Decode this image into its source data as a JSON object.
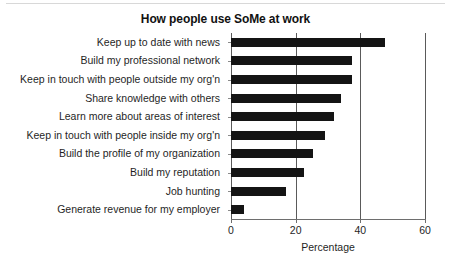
{
  "chart_data": {
    "type": "bar",
    "orientation": "horizontal",
    "title": "How people use SoMe at work",
    "xlabel": "Percentage",
    "ylabel": "",
    "xlim": [
      0,
      60
    ],
    "xticks": [
      0,
      20,
      40,
      60
    ],
    "xtick_labels": [
      "0",
      "20",
      "40",
      "60"
    ],
    "grid": "vertical",
    "legend": "none",
    "bar_color": "#141414",
    "categories": [
      "Keep up to date with news",
      "Build my professional network",
      "Keep in touch with people outside my org'n",
      "Share knowledge with others",
      "Learn more about areas of interest",
      "Keep in touch with people inside my org'n",
      "Build the profile of my organization",
      "Build my reputation",
      "Job hunting",
      "Generate revenue for my employer"
    ],
    "values": [
      47.7,
      37.5,
      37.5,
      34.0,
      32.0,
      29.0,
      25.5,
      22.5,
      17.0,
      4.0
    ]
  }
}
